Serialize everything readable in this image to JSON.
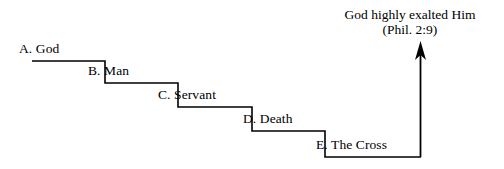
{
  "figure": {
    "background_color": "#ffffff",
    "line_color": "#000000",
    "text_color": "#000000"
  },
  "headline": {
    "line1": "God highly exalted Him",
    "line2": "(Phil. 2:9)"
  },
  "steps": [
    {
      "marker": "A.",
      "text": "God",
      "label": "A. God"
    },
    {
      "marker": "B.",
      "text": "Man",
      "label": "B. Man"
    },
    {
      "marker": "C.",
      "text": "Servant",
      "label": "C. Servant"
    },
    {
      "marker": "D.",
      "text": "Death",
      "label": "D. Death"
    },
    {
      "marker": "E.",
      "text": "The Cross",
      "label": "E. The Cross"
    }
  ],
  "arrow": {
    "direction": "up",
    "name": "exaltation-arrow"
  }
}
